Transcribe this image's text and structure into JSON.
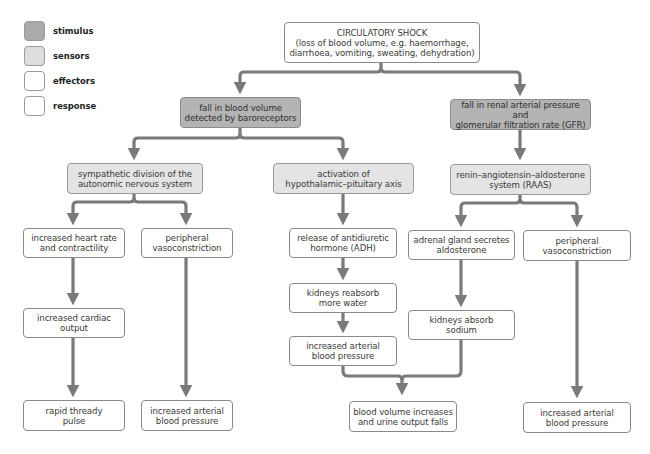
{
  "legend": [
    {
      "label": "stimulus",
      "kind": "stimulus"
    },
    {
      "label": "sensors",
      "kind": "sensor"
    },
    {
      "label": "effectors",
      "kind": "effector"
    },
    {
      "label": "response",
      "kind": "response"
    }
  ],
  "colors": {
    "stimulus_fill": "#b4b4b4",
    "sensor_fill": "#e4e4e4",
    "effector_fill": "#ffffff",
    "arrow": "#7a7a7a",
    "border": "#8a8a8a"
  },
  "nodes": {
    "shock": "CIRCULATORY SHOCK\n(loss of blood volume, e.g. haemorrhage,\ndiarrhoea, vomiting, sweating, dehydration)",
    "fall_blood_volume": "fall in blood volume\ndetected by baroreceptors",
    "fall_renal": "fall in renal arterial pressure and\nglomerular filtration rate (GFR)",
    "sympathetic": "sympathetic division of the\nautonomic nervous system",
    "hypothalamic": "activation of\nhypothalamic–pituitary axis",
    "raas": "renin–angiotensin–aldosterone\nsystem (RAAS)",
    "heart_rate": "increased heart rate\nand contractility",
    "vaso_left": "peripheral\nvasoconstriction",
    "adh": "release of antidiuretic\nhormone (ADH)",
    "adrenal": "adrenal gland secretes\naldosterone",
    "vaso_right": "peripheral\nvasoconstriction",
    "kidneys_water": "kidneys reabsorb\nmore water",
    "cardiac_output": "increased cardiac\noutput",
    "kidneys_sodium": "kidneys absorb\nsodium",
    "bp_mid": "increased arterial\nblood pressure",
    "pulse": "rapid thready\npulse",
    "bp_left": "increased arterial\nblood pressure",
    "blood_volume_increases": "blood volume increases\nand urine output falls",
    "bp_right": "increased arterial\nblood pressure"
  }
}
